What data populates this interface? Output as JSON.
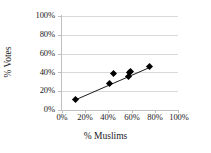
{
  "chart_data": {
    "type": "scatter",
    "title": "",
    "xlabel": "% Muslims",
    "ylabel": "% Votes",
    "xlim": [
      0,
      100
    ],
    "ylim": [
      0,
      100
    ],
    "xticks": [
      "0%",
      "20%",
      "40%",
      "60%",
      "80%",
      "100%"
    ],
    "xtick_values": [
      0,
      20,
      40,
      60,
      80,
      100
    ],
    "yticks": [
      "0%",
      "20%",
      "40%",
      "60%",
      "80%",
      "100%"
    ],
    "ytick_values": [
      0,
      20,
      40,
      60,
      80,
      100
    ],
    "grid": "horizontal",
    "legend": "none",
    "marker": "diamond",
    "marker_color": "#000000",
    "points": [
      {
        "x": 12,
        "y": 11
      },
      {
        "x": 41,
        "y": 28
      },
      {
        "x": 44,
        "y": 39
      },
      {
        "x": 57,
        "y": 36
      },
      {
        "x": 58,
        "y": 40
      },
      {
        "x": 59,
        "y": 41
      },
      {
        "x": 75,
        "y": 46
      }
    ],
    "trendline": {
      "type": "linear",
      "color": "#000000",
      "x_start": 12,
      "y_start": 11,
      "x_end": 77,
      "y_end": 46
    }
  }
}
